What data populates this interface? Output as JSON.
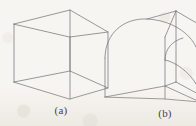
{
  "figure": {
    "kind": "line-drawing",
    "background_color": "#f7f5f1",
    "line_color": "#6e6e6e",
    "line_width": 0.7,
    "caption_color": "#454545",
    "panels": [
      {
        "id": "a",
        "label": "(a)",
        "shape_name": "cube",
        "shape_description": "Wireframe cube shown in oblique pictorial projection with all twelve edges visible"
      },
      {
        "id": "b",
        "label": "(b)",
        "shape_name": "cube-with-rounded-corner",
        "shape_description": "Wireframe cube with one vertical corner replaced by a quarter-round fillet"
      }
    ],
    "geometry": {
      "cube_a": {
        "vertices": {
          "front_top_left": [
            14,
            24
          ],
          "front_top_right": [
            70,
            37
          ],
          "back_top_left": [
            70,
            10
          ],
          "back_top_right": [
            108,
            32
          ],
          "front_bottom_left": [
            14,
            82
          ],
          "front_bottom_right": [
            70,
            99
          ],
          "back_bottom_left": [
            70,
            71
          ],
          "back_bottom_right": [
            108,
            88
          ]
        },
        "edges": [
          [
            "front_top_left",
            "back_top_left"
          ],
          [
            "back_top_left",
            "back_top_right"
          ],
          [
            "front_top_left",
            "front_top_right"
          ],
          [
            "front_top_right",
            "back_top_right"
          ],
          [
            "front_top_left",
            "front_bottom_left"
          ],
          [
            "front_top_right",
            "front_bottom_right"
          ],
          [
            "back_top_right",
            "back_bottom_right"
          ],
          [
            "back_top_left",
            "back_bottom_left"
          ],
          [
            "front_bottom_left",
            "back_bottom_left"
          ],
          [
            "back_bottom_left",
            "back_bottom_right"
          ],
          [
            "front_bottom_left",
            "front_bottom_right"
          ],
          [
            "front_bottom_right",
            "back_bottom_right"
          ]
        ]
      },
      "solid_b": {
        "fillet_radius_px": 34,
        "vertices": {
          "front_top_left_lower": [
            105,
            58
          ],
          "front_top_right": [
            165,
            37
          ],
          "back_top_corner": [
            176,
            11
          ],
          "front_bottom_left": [
            105,
            97
          ],
          "front_bottom_right": [
            165,
            99
          ],
          "back_bottom_left": [
            165,
            71
          ],
          "back_bottom_right": [
            200,
            88
          ]
        },
        "arcs": [
          {
            "name": "outer-top-fillet",
            "from": [
              105,
              58
            ],
            "to": [
              146,
              19
            ]
          },
          {
            "name": "inner-top-fillet",
            "from": [
              165,
              60
            ],
            "to": [
              200,
              46
            ]
          }
        ]
      }
    }
  }
}
